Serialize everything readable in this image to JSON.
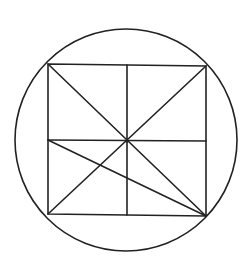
{
  "diagram": {
    "stroke_color": "#222222",
    "background": "#ffffff",
    "circle": {
      "cx": 126,
      "cy": 140,
      "r": 111
    },
    "square": {
      "top_left": [
        48,
        64
      ],
      "top_right": [
        206,
        66
      ],
      "bottom_right": [
        206,
        216
      ],
      "bottom_left": [
        48,
        214
      ]
    },
    "center_point": [
      127,
      141
    ],
    "lines": [
      {
        "name": "diagonal-tl-br",
        "from": [
          48,
          64
        ],
        "to": [
          206,
          216
        ]
      },
      {
        "name": "diagonal-tr-bl",
        "from": [
          206,
          66
        ],
        "to": [
          48,
          214
        ]
      },
      {
        "name": "vertical-midline",
        "from": [
          127,
          65
        ],
        "to": [
          127,
          215
        ]
      },
      {
        "name": "horizontal-midline",
        "from": [
          48,
          140
        ],
        "to": [
          206,
          141
        ]
      },
      {
        "name": "left-mid-to-bottom-right",
        "from": [
          48,
          140
        ],
        "to": [
          206,
          216
        ]
      }
    ]
  }
}
